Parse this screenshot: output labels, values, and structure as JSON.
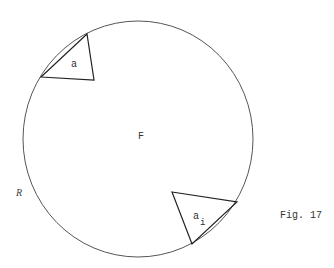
{
  "figure": {
    "caption": "Fig. 17",
    "region_label": "F",
    "boundary_label": "R",
    "circle": {
      "cx": 138,
      "cy": 139,
      "rx": 115,
      "ry": 118
    },
    "triangles": [
      {
        "label": "a",
        "subscript": "",
        "points": "41,77 94,80 87,34",
        "label_x": 71,
        "label_y": 67
      },
      {
        "label": "a",
        "subscript": "i",
        "points": "172,192 237,202 192,244",
        "label_x": 193,
        "label_y": 219,
        "sub_x": 200,
        "sub_y": 225
      }
    ]
  }
}
